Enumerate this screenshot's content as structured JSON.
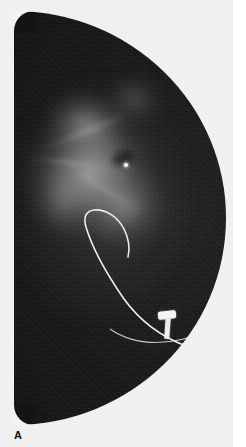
{
  "figure": {
    "panel_label": "A",
    "modality": "radiograph",
    "caption_text": "",
    "background_color": "#f3f3f3",
    "margin_color": "#ffffff",
    "tissue_color": "#141414",
    "marker_color": "#f4f4f4",
    "wire_color": "#e8e8e8"
  },
  "image": {
    "name": "specimen-radiograph",
    "shape": "oval-flat-left-edge",
    "bounds": {
      "x": 14,
      "y": 11,
      "width": 212,
      "height": 414
    }
  },
  "annotations": {
    "mass": {
      "name": "radiodense-mass",
      "description": "diffuse spiculated radiodense mass, upper-central field"
    },
    "wire": {
      "name": "localization-guide-wire",
      "description": "hook-shaped percutaneous localization wire"
    },
    "clip": {
      "name": "metallic-marker-clip",
      "description": "bright T-shaped metallic marker"
    },
    "skin_line": {
      "name": "inferior-border-line",
      "description": "thin radiopaque border line sweeping to the lower right"
    }
  }
}
